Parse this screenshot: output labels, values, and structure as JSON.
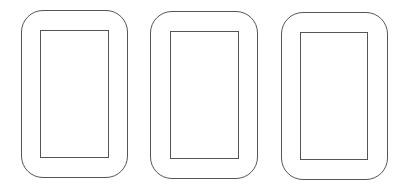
{
  "diagram": {
    "stroke_color": "#555555",
    "fill_color": "#ffffff",
    "devices": [
      {
        "frame": {
          "x": 21,
          "y": 10,
          "w": 107,
          "h": 168
        },
        "screen": {
          "x": 40,
          "y": 30,
          "w": 69,
          "h": 128
        }
      },
      {
        "frame": {
          "x": 150,
          "y": 11,
          "w": 108,
          "h": 168
        },
        "screen": {
          "x": 170,
          "y": 31,
          "w": 69,
          "h": 128
        }
      },
      {
        "frame": {
          "x": 281,
          "y": 12,
          "w": 107,
          "h": 168
        },
        "screen": {
          "x": 300,
          "y": 32,
          "w": 68,
          "h": 128
        }
      }
    ]
  }
}
